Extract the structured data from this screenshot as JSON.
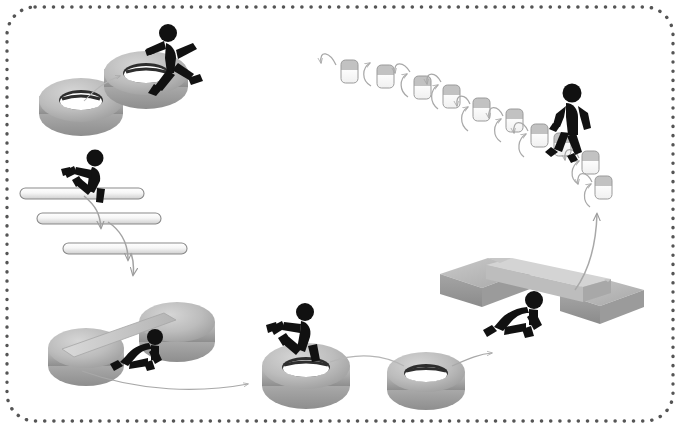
{
  "canvas": {
    "width": 680,
    "height": 428,
    "background": "#ffffff"
  },
  "border": {
    "style": "dotted-rounded-rectangle",
    "color": "#555555",
    "dot_radius": 1.7,
    "dot_spacing": 9,
    "corner_radius": 28,
    "inset": {
      "left": 7,
      "top": 7,
      "right": 673,
      "bottom": 421
    }
  },
  "palette": {
    "figure": "#111111",
    "tire_light": "#c9c9c9",
    "tire_mid": "#b0b0b0",
    "tire_dark": "#8f8f8f",
    "tire_hole": "#2b2b2b",
    "bar_fill": "#f2f2f2",
    "bar_edge": "#8a8a8a",
    "block_top": "#c4c4c4",
    "block_body": "#fbfbfb",
    "block_edge": "#9a9a9a",
    "platform_top": "#b8b8b8",
    "platform_side": "#9d9d9d",
    "platform_light": "#d6d6d6",
    "arrow": "#9a9a9a",
    "arrow_dark": "#7d7d7d"
  },
  "obstacles": [
    {
      "id": "tire-pair-upper-left",
      "name": "Tire hop (upper left)",
      "type": "tires",
      "count": 2,
      "figure": "running-leaping",
      "tires": [
        {
          "cx": 81,
          "cy": 108,
          "rx": 42,
          "ry": 22
        },
        {
          "cx": 146,
          "cy": 81,
          "rx": 42,
          "ry": 22
        }
      ]
    },
    {
      "id": "hurdle-bars",
      "name": "Horizontal bars / hurdles",
      "type": "bars",
      "count": 3,
      "figure": "running-over-bar",
      "bars": [
        {
          "x": 20,
          "y": 188,
          "w": 124,
          "h": 11
        },
        {
          "x": 37,
          "y": 213,
          "w": 124,
          "h": 11
        },
        {
          "x": 63,
          "y": 243,
          "w": 124,
          "h": 11
        }
      ]
    },
    {
      "id": "low-crawl-drums",
      "name": "Low crawl under bar on drums",
      "type": "drums-and-bar",
      "figure": "crawling",
      "drums": [
        {
          "cx": 86,
          "cy": 357,
          "rx": 36,
          "ry": 19
        },
        {
          "cx": 176,
          "cy": 332,
          "rx": 36,
          "ry": 19
        }
      ]
    },
    {
      "id": "tire-pair-lower-middle",
      "name": "Tire run (lower middle)",
      "type": "tires",
      "count": 2,
      "figure": "running-through",
      "tires": [
        {
          "cx": 306,
          "cy": 376,
          "rx": 44,
          "ry": 23
        },
        {
          "cx": 424,
          "cy": 381,
          "rx": 38,
          "ry": 20
        }
      ]
    },
    {
      "id": "bridge-platform",
      "name": "Raised bridge / beam crawl",
      "type": "platform",
      "figure": "crawling-under"
    },
    {
      "id": "block-stairs",
      "name": "Stepping blocks chain",
      "type": "blocks",
      "count": 9,
      "figure": "walking-climbing",
      "blocks": [
        {
          "x": 341,
          "y": 60,
          "w": 17,
          "h": 22
        },
        {
          "x": 377,
          "y": 66,
          "w": 17,
          "h": 22
        },
        {
          "x": 414,
          "y": 77,
          "w": 17,
          "h": 22
        },
        {
          "x": 444,
          "y": 85,
          "w": 17,
          "h": 22
        },
        {
          "x": 474,
          "y": 99,
          "w": 17,
          "h": 22
        },
        {
          "x": 507,
          "y": 109,
          "w": 17,
          "h": 22
        },
        {
          "x": 531,
          "y": 124,
          "w": 17,
          "h": 22
        },
        {
          "x": 582,
          "y": 151,
          "w": 17,
          "h": 22
        },
        {
          "x": 595,
          "y": 176,
          "w": 17,
          "h": 22
        }
      ]
    }
  ],
  "figures": [
    {
      "id": "figure-1",
      "pose": "running-leap",
      "at": {
        "x": 168,
        "y": 55
      }
    },
    {
      "id": "figure-2",
      "pose": "running-stride",
      "at": {
        "x": 82,
        "y": 175
      }
    },
    {
      "id": "figure-3",
      "pose": "crawling",
      "at": {
        "x": 138,
        "y": 339
      }
    },
    {
      "id": "figure-4",
      "pose": "running-stride",
      "at": {
        "x": 297,
        "y": 332
      }
    },
    {
      "id": "figure-5",
      "pose": "crawling",
      "at": {
        "x": 521,
        "y": 312
      }
    },
    {
      "id": "figure-6",
      "pose": "walking",
      "at": {
        "x": 570,
        "y": 110
      }
    }
  ],
  "arrows": [
    {
      "id": "arrow-tire-to-tire",
      "from": "tire-lower-left",
      "to": "tire-upper-right",
      "style": "thin-curve"
    },
    {
      "id": "arrow-bar1-bar2",
      "from": "bar-1",
      "to": "bar-2",
      "style": "curve-down"
    },
    {
      "id": "arrow-bar2-bar3",
      "from": "bar-2",
      "to": "bar-3",
      "style": "curve-down"
    },
    {
      "id": "arrow-bar3-crawl",
      "from": "bar-3",
      "to": "low-crawl-drums",
      "style": "straight-diagonal"
    },
    {
      "id": "arrow-crawl-to-tires",
      "from": "low-crawl-drums",
      "to": "tire-pair-lower-middle",
      "style": "long-curve-right"
    },
    {
      "id": "arrow-tire-to-tire-lower",
      "from": "tire-lower-1",
      "to": "tire-lower-2",
      "style": "thin-curve"
    },
    {
      "id": "arrow-tires-to-bridge",
      "from": "tire-pair-lower-middle",
      "to": "bridge-platform",
      "style": "curve-right-up"
    },
    {
      "id": "arrow-bridge-to-blocks",
      "from": "bridge-platform",
      "to": "block-stairs",
      "style": "curve-up"
    },
    {
      "id": "arrow-block-chain",
      "from": "block-stairs",
      "to": "block-stairs",
      "style": "zigzag-hook-series",
      "count": 9
    }
  ]
}
